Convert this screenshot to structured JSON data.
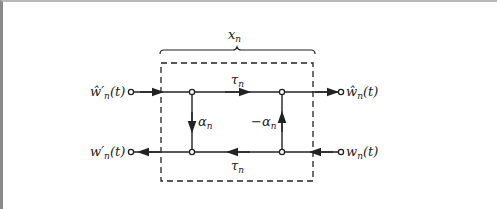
{
  "diagram": {
    "type": "signal-flow lattice section",
    "section_label": {
      "base": "x",
      "sub": "n"
    },
    "colors": {
      "line": "#222222",
      "frame_left": "#8a8a8a",
      "frame_top": "#b8b8b8",
      "background": "#ffffff"
    },
    "ports": {
      "top_left": {
        "text": "ŵ′",
        "sub": "n",
        "arg": "(t)",
        "role": "input-forward"
      },
      "top_right": {
        "text": "ŵ",
        "sub": "n",
        "arg": "(t)",
        "role": "output-forward"
      },
      "bottom_left": {
        "text": "w′",
        "sub": "n",
        "arg": "(t)",
        "role": "output-backward"
      },
      "bottom_right": {
        "text": "w",
        "sub": "n",
        "arg": "(t)",
        "role": "input-backward"
      }
    },
    "branches": {
      "top_delay": {
        "base": "τ",
        "sub": "n",
        "direction": "right"
      },
      "bottom_delay": {
        "base": "τ",
        "sub": "n",
        "direction": "left"
      },
      "left_cross": {
        "base": "α",
        "sub": "n",
        "direction": "down"
      },
      "right_cross": {
        "base": "−α",
        "sub": "n",
        "direction": "up"
      }
    }
  }
}
